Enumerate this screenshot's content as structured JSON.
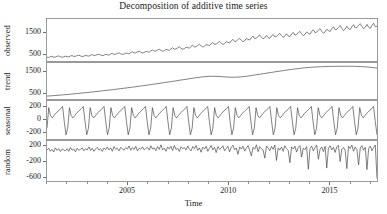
{
  "chart_data": {
    "type": "line",
    "title": "Decomposition of additive time series",
    "xlabel": "Time",
    "subplot_layout": "4 stacked panels sharing one time axis",
    "grid": false,
    "legend": false,
    "xlim": [
      2001.0,
      2017.4
    ],
    "x_ticks": [
      2005,
      2010,
      2015
    ],
    "x_tick_labels": [
      "2005",
      "2010",
      "2015"
    ],
    "x_minor_tick_step": 1,
    "line_color": "#4a4a4a",
    "frame_color": "#9a9a9a",
    "panels": [
      {
        "name": "observed",
        "ylabel": "observed",
        "y_ticks": [
          500,
          1500
        ],
        "y_tick_labels": [
          "500",
          "1500"
        ],
        "ylim": [
          120,
          2150
        ],
        "description": "Rising sawtooth series: annual seasonal cycle superimposed on a strongly increasing trend, from roughly 300 in 2001 to about 1900 in 2017.",
        "values": [
          300,
          290,
          330,
          350,
          300,
          315,
          345,
          365,
          330,
          300,
          320,
          355,
          330,
          320,
          360,
          385,
          340,
          350,
          380,
          400,
          365,
          335,
          355,
          390,
          370,
          355,
          400,
          430,
          385,
          395,
          425,
          450,
          410,
          380,
          400,
          440,
          420,
          405,
          455,
          490,
          440,
          450,
          485,
          515,
          470,
          435,
          460,
          505,
          485,
          470,
          525,
          565,
          510,
          520,
          560,
          595,
          545,
          505,
          535,
          585,
          565,
          545,
          610,
          655,
          595,
          605,
          650,
          690,
          635,
          590,
          620,
          680,
          660,
          635,
          710,
          760,
          690,
          700,
          755,
          800,
          735,
          685,
          720,
          790,
          765,
          740,
          825,
          880,
          800,
          815,
          875,
          925,
          855,
          795,
          835,
          915,
          890,
          860,
          955,
          1015,
          925,
          940,
          1010,
          1065,
          985,
          920,
          960,
          1055,
          1025,
          990,
          1095,
          1165,
          1060,
          1080,
          1155,
          1215,
          1125,
          1050,
          1100,
          1205,
          1170,
          1130,
          1245,
          1325,
          1205,
          1225,
          1310,
          1375,
          1275,
          1190,
          1245,
          1360,
          1245,
          1210,
          1330,
          1405,
          1285,
          1300,
          1390,
          1455,
          1350,
          1265,
          1320,
          1435,
          1330,
          1295,
          1420,
          1500,
          1370,
          1390,
          1480,
          1550,
          1435,
          1345,
          1405,
          1525,
          1455,
          1415,
          1545,
          1630,
          1495,
          1515,
          1610,
          1685,
          1560,
          1465,
          1525,
          1655,
          1590,
          1545,
          1685,
          1775,
          1630,
          1650,
          1750,
          1830,
          1695,
          1595,
          1660,
          1795,
          1680,
          1635,
          1780,
          1875,
          1720,
          1740,
          1845,
          1925,
          1785,
          1680,
          1750,
          1890,
          1750,
          1700,
          1845,
          1940,
          1780,
          1800
        ]
      },
      {
        "name": "trend",
        "ylabel": "trend",
        "y_ticks": [
          500,
          1500
        ],
        "y_tick_labels": [
          "500",
          "1500"
        ],
        "ylim": [
          180,
          1900
        ],
        "description": "Smooth centred moving-average trend rising from about 320 in 2001 to about 1750 by 2016, with a visible flattening and dip near 2010-2011 and a small downturn at the right end.",
        "values": [
          320,
          330,
          342,
          355,
          368,
          382,
          396,
          410,
          425,
          440,
          456,
          472,
          488,
          505,
          522,
          540,
          558,
          576,
          595,
          614,
          633,
          652,
          672,
          692,
          712,
          733,
          754,
          775,
          797,
          819,
          841,
          864,
          887,
          910,
          934,
          958,
          982,
          1006,
          1031,
          1056,
          1081,
          1106,
          1131,
          1156,
          1180,
          1203,
          1224,
          1242,
          1256,
          1264,
          1266,
          1262,
          1252,
          1240,
          1229,
          1222,
          1220,
          1224,
          1234,
          1250,
          1270,
          1293,
          1317,
          1342,
          1367,
          1392,
          1417,
          1442,
          1467,
          1492,
          1516,
          1540,
          1563,
          1585,
          1606,
          1626,
          1645,
          1662,
          1678,
          1692,
          1704,
          1714,
          1722,
          1728,
          1733,
          1737,
          1740,
          1742,
          1743,
          1744,
          1744,
          1743,
          1741,
          1737,
          1731,
          1722,
          1710,
          1694,
          1676,
          1658
        ]
      },
      {
        "name": "seasonal",
        "ylabel": "seasonal",
        "y_ticks": [
          200,
          0,
          -200
        ],
        "y_tick_labels": [
          "200",
          "0",
          "-200"
        ],
        "ylim": [
          -330,
          300
        ],
        "description": "Strictly periodic annual sawtooth repeated about 16 times: sharp spike up to roughly 190, a dip, a gradual climb to a second peak near 210, then a steep fall to about -260 before recovering.",
        "period_length": 12,
        "cycle_values": [
          -150,
          190,
          60,
          20,
          55,
          95,
          120,
          150,
          175,
          210,
          -40,
          -260
        ],
        "cycles": 16
      },
      {
        "name": "random",
        "ylabel": "random",
        "y_ticks": [
          200,
          -200,
          -600
        ],
        "y_tick_labels": [
          "200",
          "-200",
          "-600"
        ],
        "ylim": [
          -720,
          330
        ],
        "description": "Irregular residual noise fluctuating mostly between -120 and 230 around zero, with increasing volatility after 2013, several deep negative excursions near -400 around 2014-2016, and one extreme drop to about -650 at the very end of the series.",
        "values": [
          90,
          140,
          60,
          110,
          40,
          150,
          80,
          130,
          55,
          120,
          95,
          70,
          130,
          60,
          160,
          90,
          120,
          45,
          140,
          85,
          110,
          150,
          70,
          125,
          95,
          175,
          80,
          140,
          60,
          120,
          165,
          90,
          130,
          55,
          145,
          100,
          175,
          95,
          150,
          60,
          185,
          110,
          140,
          70,
          165,
          120,
          90,
          155,
          120,
          200,
          85,
          160,
          105,
          190,
          70,
          145,
          115,
          175,
          95,
          135,
          165,
          90,
          205,
          120,
          150,
          75,
          185,
          110,
          230,
          95,
          145,
          60,
          175,
          120,
          195,
          80,
          215,
          105,
          140,
          55,
          180,
          125,
          160,
          90,
          200,
          115,
          70,
          185,
          130,
          210,
          85,
          150,
          35,
          170,
          120,
          195,
          60,
          140,
          215,
          95,
          165,
          25,
          185,
          110,
          145,
          205,
          70,
          130,
          190,
          45,
          160,
          220,
          100,
          150,
          -20,
          175,
          120,
          195,
          65,
          140,
          210,
          85,
          -60,
          165,
          115,
          230,
          50,
          180,
          130,
          95,
          -120,
          200,
          145,
          75,
          190,
          110,
          225,
          -180,
          150,
          95,
          170,
          60,
          205,
          130,
          85,
          -240,
          175,
          120,
          195,
          40,
          160,
          210,
          -90,
          145,
          100,
          185,
          -410,
          130,
          200,
          70,
          155,
          225,
          -150,
          110,
          175,
          50,
          190,
          -380,
          140,
          205,
          95,
          165,
          30,
          180,
          215,
          -210,
          120,
          160,
          85,
          -395,
          195,
          135,
          225,
          60,
          175,
          105,
          -300,
          150,
          210,
          90,
          165,
          -420,
          130,
          195,
          75,
          160,
          225,
          -650
        ]
      }
    ]
  }
}
